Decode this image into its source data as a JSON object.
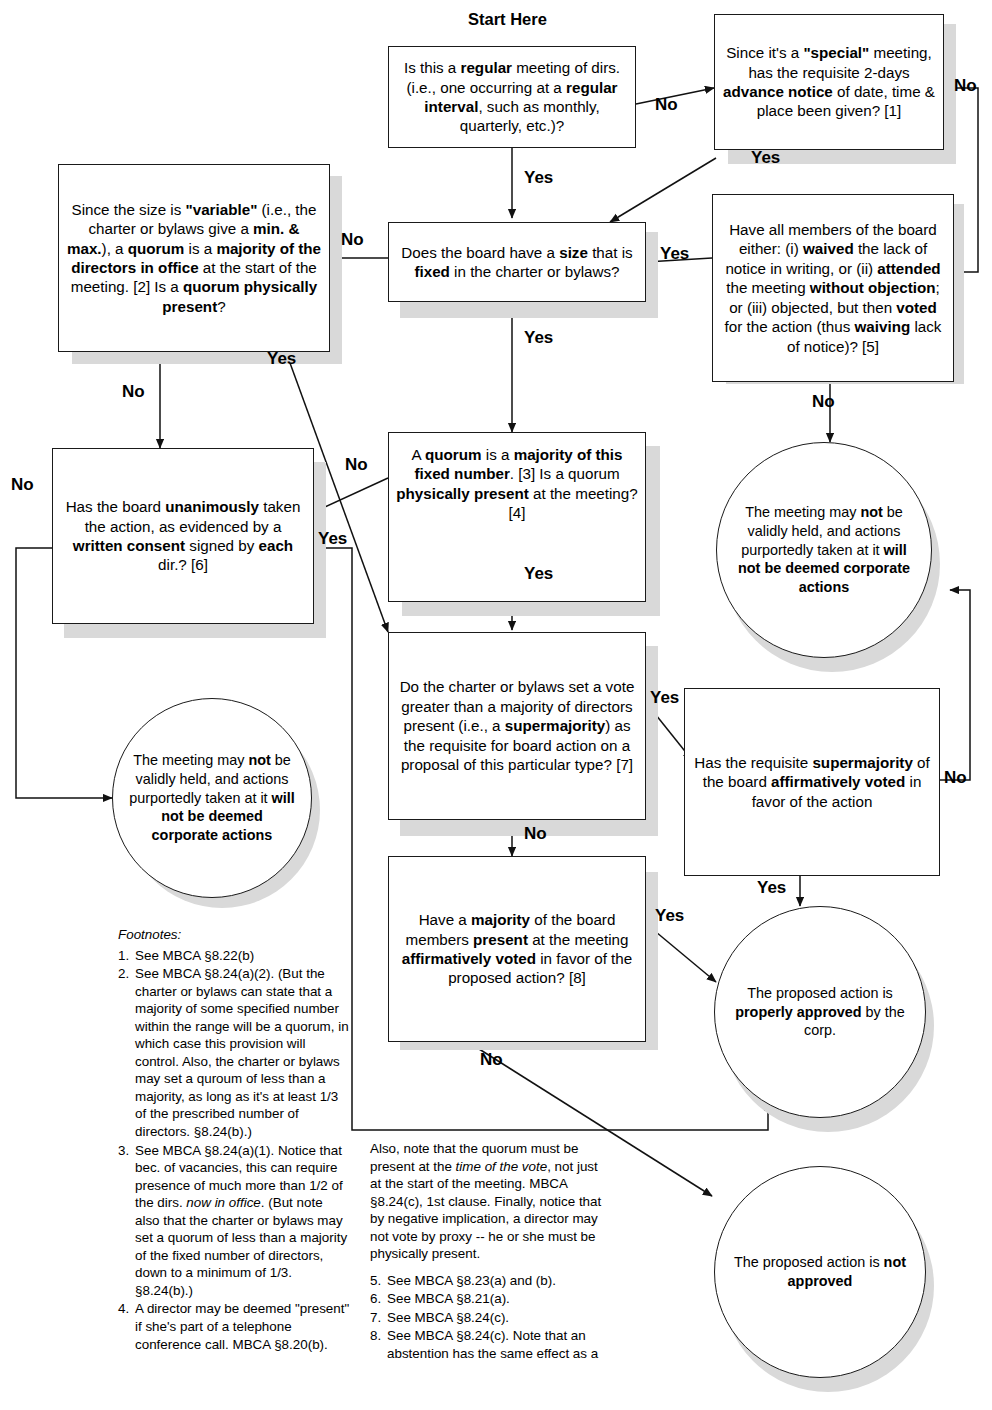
{
  "labels": {
    "start_here": "Start Here",
    "yes": "Yes",
    "no": "No"
  },
  "nodes": {
    "q_regular": {
      "name": "is-regular-meeting",
      "text_html": "Is this a <b>regular</b> meeting of dirs. (i.e., one occurring at a <b>regular interval</b>, such as monthly, quarterly, etc.)?",
      "text": "Is this a regular meeting of dirs. (i.e., one occurring at a regular interval, such as monthly, quarterly, etc.)?"
    },
    "q_notice": {
      "name": "special-meeting-notice",
      "text_html": "Since it's a <b>\"special\"</b> meeting, has the requisite 2-days <b>advance notice</b> of date, time &amp; place been given? [1]",
      "text": "Since it's a \"special\" meeting, has the requisite 2-days advance notice of date, time & place been given? [1]"
    },
    "q_waiver": {
      "name": "waiver-of-notice",
      "text_html": "Have all members of the board either: (i) <b>waived</b> the lack of notice in writing, or (ii) <b>attended</b> the meeting <b>without objection</b>; or (iii) objected, but then <b>voted</b> for the action (thus <b>waiving</b> lack of notice)? [5]",
      "text": "Have all members of the board either: (i) waived the lack of notice in writing, or (ii) attended the meeting without objection; or (iii) objected, but then voted for the action (thus waiving lack of notice)? [5]"
    },
    "q_fixed_size": {
      "name": "board-size-fixed",
      "text_html": "Does the board have a <b>size</b> that is <b>fixed</b> in the charter or bylaws?",
      "text": "Does the board have a size that is fixed in the charter or bylaws?"
    },
    "q_variable_quorum": {
      "name": "variable-size-quorum",
      "text_html": "Since the size is <b>\"variable\"</b> (i.e., the charter or bylaws give a <b>min. &amp; max.</b>), a <b>quorum</b> is a <b>majority of the directors in office</b> at the start of the meeting. [2] Is a <b>quorum physically present</b>?",
      "text": "Since the size is \"variable\" (i.e., the charter or bylaws give a min. & max.), a quorum is a majority of the directors in office at the start of the meeting. [2] Is a quorum physically present?"
    },
    "q_fixed_quorum": {
      "name": "fixed-number-quorum",
      "text_html": "A <b>quorum</b> is a <b>majority of this fixed number</b>. [3] Is a quorum <b>physically present</b> at the meeting? [4]",
      "text": "A quorum is a majority of this fixed number. [3] Is a quorum physically present at the meeting? [4]"
    },
    "q_written_consent": {
      "name": "unanimous-written-consent",
      "text_html": "Has the board <b>unanimously</b> taken the action, as evidenced by a <b>written consent</b> signed by <b>each</b> dir.? [6]",
      "text": "Has the board unanimously taken the action, as evidenced by a written consent signed by each dir.? [6]"
    },
    "q_supermajority": {
      "name": "supermajority-required",
      "text_html": "Do the charter or bylaws set a vote greater than a majority of directors present (i.e., a <b>supermajority</b>) as the requisite for board action on a proposal of this particular type? [7]",
      "text": "Do the charter or bylaws set a vote greater than a majority of directors present (i.e., a supermajority) as the requisite for board action on a proposal of this particular type? [7]"
    },
    "q_supermajority_voted": {
      "name": "supermajority-voted",
      "text_html": "Has the requisite <b>supermajority</b> of the board <b>affirmatively voted</b> in favor of the action",
      "text": "Has the requisite supermajority of the board affirmatively voted in favor of the action"
    },
    "q_majority_voted": {
      "name": "majority-voted",
      "text_html": "Have a <b>majority</b> of the board members <b>present</b> at the meeting <b>affirmatively voted</b> in favor of the proposed action? [8]",
      "text": "Have a majority of the board members present at the meeting affirmatively voted in favor of the proposed action? [8]"
    },
    "end_invalid_right": {
      "name": "outcome-meeting-invalid-right",
      "text_html": "The meeting may <b>not</b> be validly held, and actions purportedly taken at it <b>will not be deemed corporate actions</b>",
      "text": "The meeting may not be validly held, and actions purportedly taken at it will not be deemed corporate actions"
    },
    "end_invalid_left": {
      "name": "outcome-meeting-invalid-left",
      "text_html": "The meeting may <b>not</b> be validly held, and actions purportedly taken at it <b>will not be deemed corporate actions</b>",
      "text": "The meeting may not be validly held, and actions purportedly taken at it will not be deemed corporate actions"
    },
    "end_approved": {
      "name": "outcome-properly-approved",
      "text_html": "The proposed action is <b>properly approved</b> by the corp.",
      "text": "The proposed action is properly approved by the corp."
    },
    "end_not_approved": {
      "name": "outcome-not-approved",
      "text_html": "The proposed action is <b>not approved</b>",
      "text": "The proposed action is not approved"
    }
  },
  "footnotes": {
    "heading": "Footnotes:",
    "left": [
      {
        "num": "1.",
        "html": "See MBCA &sect;8.22(b)"
      },
      {
        "num": "2.",
        "html": "See MBCA &sect;8.24(a)(2). (But the charter or bylaws can state that a majority of some specified number within the range will be a quorum, in which case this provision will control. Also, the charter or bylaws may set a quroum of less than a majority, as long as it's at least 1/3 of the prescribed number of directors. &sect;8.24(b).)"
      },
      {
        "num": "3.",
        "html": "See MBCA &sect;8.24(a)(1). Notice that bec. of vacancies, this can require presence of much more than 1/2 of the dirs. <i>now in office</i>. (But note also that the charter or bylaws may set a quorum of less than a majority of the fixed number of directors, down to a minimum of 1/3. &sect;8.24(b).)"
      },
      {
        "num": "4.",
        "html": "A director may be deemed \"present\" if she's part of a telephone conference call. MBCA &sect;8.20(b)."
      }
    ],
    "right_intro": "Also, note that the quorum must be present at the <i>time of the vote</i>, not just at the start of the meeting. MBCA &sect;8.24(c), 1st clause. Finally, notice that by negative implication, a director may not vote by proxy -- he or she must be physically present.",
    "right": [
      {
        "num": "5.",
        "html": "See MBCA &sect;8.23(a) and (b)."
      },
      {
        "num": "6.",
        "html": "See MBCA &sect;8.21(a)."
      },
      {
        "num": "7.",
        "html": "See MBCA &sect;8.24(c)."
      },
      {
        "num": "8.",
        "html": "See MBCA &sect;8.24(c). Note that an abstention has the same effect as a"
      }
    ]
  },
  "edges": [
    {
      "from": "q_regular",
      "to": "q_notice",
      "label": "No"
    },
    {
      "from": "q_regular",
      "to": "q_fixed_size",
      "label": "Yes"
    },
    {
      "from": "q_notice",
      "to": "q_fixed_size",
      "label": "Yes"
    },
    {
      "from": "q_notice",
      "to": "q_waiver",
      "label": "No"
    },
    {
      "from": "q_waiver",
      "to": "q_fixed_size",
      "label": "Yes"
    },
    {
      "from": "q_waiver",
      "to": "end_invalid_right",
      "label": "No"
    },
    {
      "from": "q_fixed_size",
      "to": "q_variable_quorum",
      "label": "No"
    },
    {
      "from": "q_fixed_size",
      "to": "q_fixed_quorum",
      "label": "Yes"
    },
    {
      "from": "q_variable_quorum",
      "to": "q_supermajority",
      "label": "Yes"
    },
    {
      "from": "q_variable_quorum",
      "to": "q_written_consent",
      "label": "No"
    },
    {
      "from": "q_fixed_quorum",
      "to": "q_supermajority",
      "label": "Yes"
    },
    {
      "from": "q_fixed_quorum",
      "to": "q_written_consent",
      "label": "No"
    },
    {
      "from": "q_written_consent",
      "to": "end_invalid_left",
      "label": "No"
    },
    {
      "from": "q_written_consent",
      "to": "end_approved",
      "label": "Yes"
    },
    {
      "from": "q_supermajority",
      "to": "q_supermajority_voted",
      "label": "Yes"
    },
    {
      "from": "q_supermajority",
      "to": "q_majority_voted",
      "label": "No"
    },
    {
      "from": "q_supermajority_voted",
      "to": "end_approved",
      "label": "Yes"
    },
    {
      "from": "q_supermajority_voted",
      "to": "end_invalid_right",
      "label": "No"
    },
    {
      "from": "q_majority_voted",
      "to": "end_approved",
      "label": "Yes"
    },
    {
      "from": "q_majority_voted",
      "to": "end_not_approved",
      "label": "No"
    }
  ],
  "colors": {
    "stroke": "#1a1a1a",
    "shadow": "#d9d9d9",
    "background": "#ffffff"
  }
}
